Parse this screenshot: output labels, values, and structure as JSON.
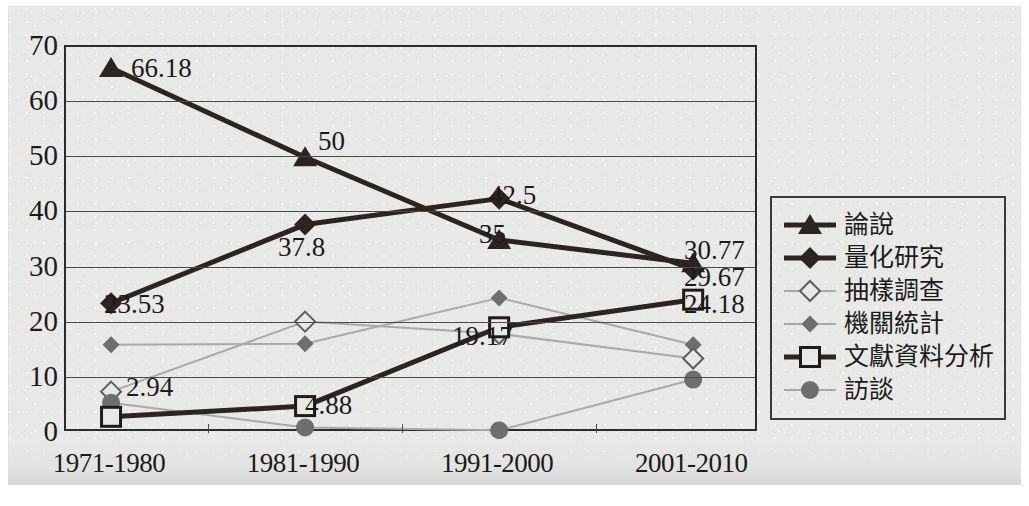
{
  "chart_data": {
    "type": "line",
    "title": "",
    "xlabel": "",
    "ylabel": "",
    "categories": [
      "1971-1980",
      "1981-1990",
      "1991-2000",
      "2001-2010"
    ],
    "ylim": [
      0,
      70
    ],
    "ytick_step": 10,
    "yticks": [
      "0",
      "10",
      "20",
      "30",
      "40",
      "50",
      "60",
      "70"
    ],
    "grid": true,
    "legend_position": "right",
    "series": [
      {
        "name": "論說",
        "marker": "filled-triangle",
        "color": "#2b2420",
        "width": 5,
        "values": [
          66.18,
          50,
          35,
          30.77
        ],
        "labels": [
          "66.18",
          "50",
          "35",
          "30.77"
        ]
      },
      {
        "name": "量化研究",
        "marker": "filled-diamond",
        "color": "#2b2420",
        "width": 5,
        "values": [
          23.53,
          37.8,
          42.5,
          29.67
        ],
        "labels": [
          "23.53",
          "37.8",
          "42.5",
          "29.67"
        ]
      },
      {
        "name": "抽樣調查",
        "marker": "hollow-diamond",
        "color": "#a9a9a9",
        "width": 2,
        "values": [
          7.5,
          20.2,
          18.0,
          13.5
        ],
        "labels": [
          "",
          "",
          "",
          ""
        ]
      },
      {
        "name": "機關統計",
        "marker": "small-filled-diamond",
        "color": "#a9a9a9",
        "width": 2,
        "values": [
          16.0,
          16.2,
          24.5,
          16.0
        ],
        "labels": [
          "",
          "",
          "",
          ""
        ]
      },
      {
        "name": "文獻資料分析",
        "marker": "hollow-square",
        "color": "#2b2420",
        "width": 5,
        "values": [
          2.94,
          4.88,
          19.17,
          24.18
        ],
        "labels": [
          "2.94",
          "4.88",
          "19.17",
          "24.18"
        ]
      },
      {
        "name": "訪談",
        "marker": "filled-circle",
        "color": "#a9a9a9",
        "width": 2,
        "values": [
          5.5,
          1.0,
          0.5,
          9.7
        ],
        "labels": [
          "",
          "",
          "",
          ""
        ]
      }
    ]
  },
  "legend": {
    "items": [
      {
        "label": "論說"
      },
      {
        "label": "量化研究"
      },
      {
        "label": "抽樣調查"
      },
      {
        "label": "機關統計"
      },
      {
        "label": "文獻資料分析"
      },
      {
        "label": "訪談"
      }
    ]
  },
  "axis": {
    "ytick_labels": [
      "70",
      "60",
      "50",
      "40",
      "30",
      "20",
      "10",
      "0"
    ],
    "xtick_labels": [
      "1971-1980",
      "1981-1990",
      "1991-2000",
      "2001-2010"
    ]
  },
  "data_labels": [
    {
      "text": "66.18",
      "x": 131,
      "y": 55
    },
    {
      "text": "50",
      "x": 318,
      "y": 128
    },
    {
      "text": "42.5",
      "x": 489,
      "y": 182
    },
    {
      "text": "35",
      "x": 479,
      "y": 221
    },
    {
      "text": "30.77",
      "x": 684,
      "y": 237
    },
    {
      "text": "29.67",
      "x": 684,
      "y": 264
    },
    {
      "text": "24.18",
      "x": 684,
      "y": 291
    },
    {
      "text": "23.53",
      "x": 104,
      "y": 291
    },
    {
      "text": "37.8",
      "x": 278,
      "y": 234
    },
    {
      "text": "19.17",
      "x": 452,
      "y": 323
    },
    {
      "text": "2.94",
      "x": 126,
      "y": 374
    },
    {
      "text": "4.88",
      "x": 305,
      "y": 392
    }
  ]
}
